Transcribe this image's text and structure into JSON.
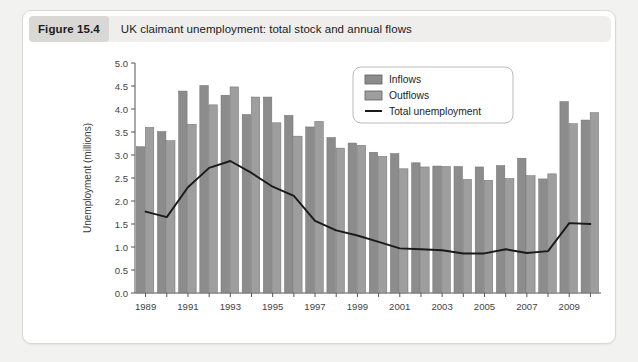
{
  "figure": {
    "number_label": "Figure 15.4",
    "caption": "UK claimant unemployment: total stock and annual flows"
  },
  "colors": {
    "inflow_bar": "#8c8c8c",
    "outflow_bar": "#9e9e9e",
    "line": "#1a1a1a",
    "card_bg": "#ffffff",
    "header_bg": "#efeeec",
    "number_bg": "#d9d8d5",
    "page_bg": "#f2f2f0",
    "axis": "#555555"
  },
  "legend": {
    "items": [
      {
        "label": "Inflows",
        "kind": "swatch",
        "color": "#8c8c8c"
      },
      {
        "label": "Outflows",
        "kind": "swatch",
        "color": "#9e9e9e"
      },
      {
        "label": "Total unemployment",
        "kind": "line",
        "color": "#1a1a1a"
      }
    ]
  },
  "chart_data": {
    "type": "bar",
    "title": "UK claimant unemployment: total stock and annual flows",
    "xlabel": "",
    "ylabel": "Unemployment (millions)",
    "ylim": [
      0.0,
      5.0
    ],
    "ytick_step": 0.5,
    "yticks": [
      "0.0",
      "0.5",
      "1.0",
      "1.5",
      "2.0",
      "2.5",
      "3.0",
      "3.5",
      "4.0",
      "4.5",
      "5.0"
    ],
    "grid": false,
    "legend_position": "top-center-right",
    "categories": [
      1989,
      1990,
      1991,
      1992,
      1993,
      1994,
      1995,
      1996,
      1997,
      1998,
      1999,
      2000,
      2001,
      2002,
      2003,
      2004,
      2005,
      2006,
      2007,
      2008,
      2009,
      2010
    ],
    "xtick_labels": [
      "1989",
      "1991",
      "1993",
      "1995",
      "1997",
      "1999",
      "2001",
      "2003",
      "2005",
      "2007",
      "2009"
    ],
    "xtick_categories": [
      1989,
      1991,
      1993,
      1995,
      1997,
      1999,
      2001,
      2003,
      2005,
      2007,
      2009
    ],
    "series": [
      {
        "name": "Inflows",
        "type": "bar",
        "color": "#8c8c8c",
        "values": [
          3.18,
          3.51,
          4.39,
          4.51,
          4.3,
          3.88,
          4.26,
          3.86,
          3.61,
          3.38,
          3.26,
          3.06,
          3.03,
          2.83,
          2.76,
          2.75,
          2.74,
          2.77,
          2.93,
          2.48,
          4.16,
          3.76
        ]
      },
      {
        "name": "Outflows",
        "type": "bar",
        "color": "#9e9e9e",
        "values": [
          3.6,
          3.31,
          3.67,
          4.09,
          4.48,
          4.26,
          3.7,
          3.41,
          3.73,
          3.15,
          3.21,
          2.97,
          2.7,
          2.74,
          2.75,
          2.47,
          2.45,
          2.49,
          2.55,
          2.59,
          3.68,
          3.92
        ]
      },
      {
        "name": "Total unemployment",
        "type": "line",
        "color": "#1a1a1a",
        "values": [
          1.77,
          1.65,
          2.3,
          2.72,
          2.87,
          2.61,
          2.31,
          2.11,
          1.57,
          1.36,
          1.25,
          1.11,
          0.97,
          0.95,
          0.93,
          0.86,
          0.86,
          0.95,
          0.87,
          0.91,
          1.52,
          1.5
        ]
      }
    ]
  }
}
